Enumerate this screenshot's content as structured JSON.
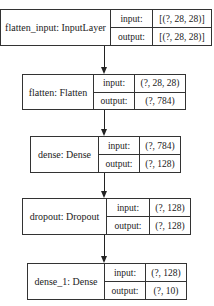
{
  "diagram": {
    "type": "keras-model-plot",
    "layers": [
      {
        "label": "flatten_input: InputLayer",
        "input_label": "input:",
        "output_label": "output:",
        "input_shape": "[(?, 28, 28)]",
        "output_shape": "[(?, 28, 28)]"
      },
      {
        "label": "flatten: Flatten",
        "input_label": "input:",
        "output_label": "output:",
        "input_shape": "(?, 28, 28)",
        "output_shape": "(?, 784)"
      },
      {
        "label": "dense: Dense",
        "input_label": "input:",
        "output_label": "output:",
        "input_shape": "(?, 784)",
        "output_shape": "(?, 128)"
      },
      {
        "label": "dropout: Dropout",
        "input_label": "input:",
        "output_label": "output:",
        "input_shape": "(?, 128)",
        "output_shape": "(?, 128)"
      },
      {
        "label": "dense_1: Dense",
        "input_label": "input:",
        "output_label": "output:",
        "input_shape": "(?, 128)",
        "output_shape": "(?, 10)"
      }
    ],
    "edges": [
      {
        "from": "flatten_input",
        "to": "flatten"
      },
      {
        "from": "flatten",
        "to": "dense"
      },
      {
        "from": "dense",
        "to": "dropout"
      },
      {
        "from": "dropout",
        "to": "dense_1"
      }
    ]
  }
}
